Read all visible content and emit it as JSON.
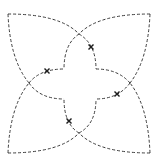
{
  "diagram": {
    "type": "dashed-curve-figure",
    "stroke_color": "#3c3c3c",
    "marker_color": "#1e1e1e",
    "background": "#ffffff",
    "outer_corners": [
      [
        8,
        14
      ],
      [
        150,
        14
      ],
      [
        8,
        153
      ],
      [
        150,
        153
      ]
    ],
    "crossings": [
      [
        79,
        34
      ],
      [
        29,
        83
      ],
      [
        130,
        83
      ],
      [
        79,
        133
      ]
    ],
    "inner_corners": [
      [
        64,
        69
      ],
      [
        96,
        69
      ],
      [
        64,
        99
      ],
      [
        96,
        99
      ]
    ],
    "markers": [
      {
        "x": 91,
        "y": 47,
        "shape": "x"
      },
      {
        "x": 47,
        "y": 71,
        "shape": "x"
      },
      {
        "x": 117,
        "y": 94,
        "shape": "x"
      },
      {
        "x": 69,
        "y": 121,
        "shape": "x"
      }
    ],
    "paths": [
      {
        "name": "top-left-petal-top",
        "d": "M 8 14 Q 60 14 79 34"
      },
      {
        "name": "top-left-petal-left",
        "d": "M 8 14 Q 10 60 29 83"
      },
      {
        "name": "top-right-petal-top",
        "d": "M 150 14 Q 98 14 79 34"
      },
      {
        "name": "top-right-petal-right",
        "d": "M 150 14 Q 148 60 130 83"
      },
      {
        "name": "bottom-left-petal-bottom",
        "d": "M 8 153 Q 60 153 79 133"
      },
      {
        "name": "bottom-left-petal-left",
        "d": "M 8 153 Q 10 106 29 83"
      },
      {
        "name": "bottom-right-petal-bottom",
        "d": "M 150 153 Q 98 153 79 133"
      },
      {
        "name": "bottom-right-petal-right",
        "d": "M 150 153 Q 148 106 130 83"
      },
      {
        "name": "top-cross-left",
        "d": "M 79 34 Q 64 44 64 69"
      },
      {
        "name": "top-cross-right",
        "d": "M 79 34 Q 96 44 96 69"
      },
      {
        "name": "left-cross-top",
        "d": "M 29 83 Q 40 69 64 69"
      },
      {
        "name": "left-cross-bottom",
        "d": "M 29 83 Q 40 99 64 99"
      },
      {
        "name": "right-cross-top",
        "d": "M 130 83 Q 118 69 96 69"
      },
      {
        "name": "right-cross-bottom",
        "d": "M 130 83 Q 118 99 96 99"
      },
      {
        "name": "bottom-cross-left",
        "d": "M 79 133 Q 64 124 64 99"
      },
      {
        "name": "bottom-cross-right",
        "d": "M 79 133 Q 96 124 96 99"
      }
    ]
  }
}
